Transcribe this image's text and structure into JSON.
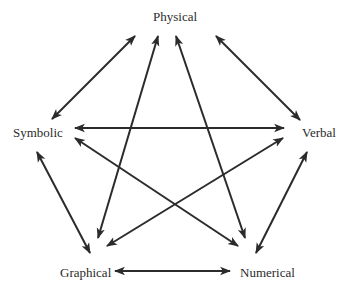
{
  "diagram": {
    "type": "pentagram-relationship-diagram",
    "nodes": [
      {
        "id": "physical",
        "label": "Physical"
      },
      {
        "id": "symbolic",
        "label": "Symbolic"
      },
      {
        "id": "verbal",
        "label": "Verbal"
      },
      {
        "id": "graphical",
        "label": "Graphical"
      },
      {
        "id": "numerical",
        "label": "Numerical"
      }
    ],
    "edges": [
      {
        "from": "physical",
        "to": "symbolic",
        "arrow": "both"
      },
      {
        "from": "physical",
        "to": "verbal",
        "arrow": "both"
      },
      {
        "from": "physical",
        "to": "graphical",
        "arrow": "both"
      },
      {
        "from": "physical",
        "to": "numerical",
        "arrow": "both"
      },
      {
        "from": "symbolic",
        "to": "verbal",
        "arrow": "both"
      },
      {
        "from": "symbolic",
        "to": "numerical",
        "arrow": "both"
      },
      {
        "from": "verbal",
        "to": "graphical",
        "arrow": "both"
      },
      {
        "from": "symbolic",
        "to": "graphical",
        "arrow": "both"
      },
      {
        "from": "verbal",
        "to": "numerical",
        "arrow": "both"
      },
      {
        "from": "graphical",
        "to": "numerical",
        "arrow": "both"
      }
    ],
    "colors": {
      "line": "#2b2b2b",
      "text": "#2b2b2b",
      "background": "#ffffff"
    }
  }
}
